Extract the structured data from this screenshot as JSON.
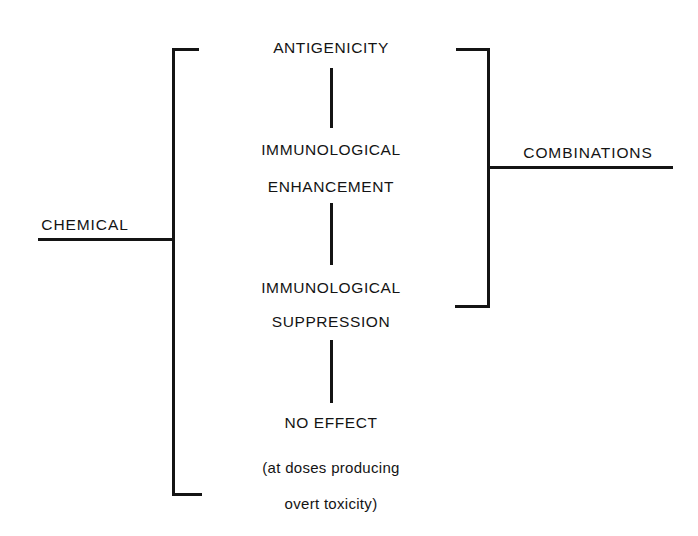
{
  "diagram": {
    "stroke_color": "#141414",
    "background_color": "#ffffff",
    "left_group": {
      "label": "CHEMICAL",
      "bracket_orientation": "opens-right"
    },
    "right_group": {
      "label": "COMBINATIONS",
      "bracket_orientation": "opens-left"
    },
    "outcomes": [
      {
        "id": "antigenicity",
        "lines": [
          "ANTIGENICITY"
        ]
      },
      {
        "id": "immunological-enhancement",
        "lines": [
          "IMMUNOLOGICAL",
          "ENHANCEMENT"
        ]
      },
      {
        "id": "immunological-suppression",
        "lines": [
          "IMMUNOLOGICAL",
          "SUPPRESSION"
        ]
      },
      {
        "id": "no-effect",
        "lines": [
          "NO EFFECT"
        ]
      }
    ],
    "nodes": {
      "antigenicity": "ANTIGENICITY",
      "immunological_1": "IMMUNOLOGICAL",
      "enhancement": "ENHANCEMENT",
      "immunological_2": "IMMUNOLOGICAL",
      "suppression": "SUPPRESSION",
      "no_effect": "NO EFFECT",
      "qualifier_line_1": "(at doses producing",
      "qualifier_line_2": "overt toxicity)"
    }
  }
}
